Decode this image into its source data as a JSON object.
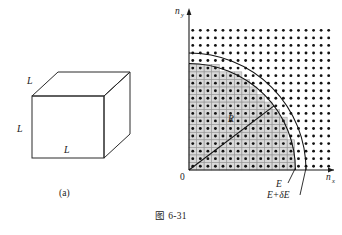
{
  "figure": {
    "caption": "图 6-31",
    "panel_a": {
      "label": "(a)",
      "edge_label_top": "L",
      "edge_label_left": "L",
      "edge_label_bottom": "L"
    },
    "panel_b": {
      "label": "(b)",
      "axis_y": "n",
      "axis_y_sub": "y",
      "axis_x": "n",
      "axis_x_sub": "x",
      "origin": "0",
      "radius_label": "R",
      "energy_inner": "E",
      "energy_outer": "E+δE"
    }
  },
  "chart_data": {
    "type": "scatter",
    "title": "图 6-31",
    "xlabel": "n_x",
    "ylabel": "n_y",
    "xlim": [
      0,
      19
    ],
    "ylim": [
      0,
      19
    ],
    "lattice": {
      "spacing": 1,
      "dot_radius": 0.19,
      "nx_count": 19,
      "ny_count": 19,
      "origin_offset": 0.5
    },
    "arcs": [
      {
        "name": "E",
        "radius": 14.1,
        "label": "E"
      },
      {
        "name": "E+δE",
        "radius": 15.5,
        "label": "E+δE"
      }
    ],
    "radius_line": {
      "label": "R",
      "from": [
        0,
        0
      ],
      "to": [
        14.1,
        0
      ],
      "angle_deg": 37
    },
    "shaded_region": {
      "type": "quarter-disk-cells",
      "radius": 14.1
    },
    "grid": true,
    "legend": "none"
  },
  "colors": {
    "ink": "#1a1a1a",
    "grid": "#9a9a9a",
    "dot": "#111111",
    "cell_fill": "#d9d9d9",
    "background": "#ffffff"
  }
}
